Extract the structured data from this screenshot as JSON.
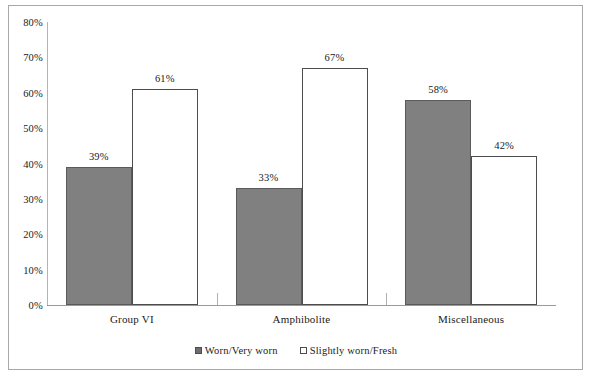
{
  "chart_data": {
    "type": "bar",
    "title": "",
    "subtitle": "",
    "xlabel": "",
    "ylabel": "",
    "categories": [
      "Group VI",
      "Amphibolite",
      "Miscellaneous"
    ],
    "series": [
      {
        "name": "Worn/Very worn",
        "values": [
          39,
          33,
          58
        ],
        "value_labels": [
          "39%",
          "33%",
          "58%"
        ],
        "color": "#808080",
        "style": "filled-gray"
      },
      {
        "name": "Slightly worn/Fresh",
        "values": [
          61,
          67,
          42
        ],
        "value_labels": [
          "61%",
          "67%",
          "42%"
        ],
        "color": "#ffffff",
        "style": "white-outlined"
      }
    ],
    "ylim": [
      0,
      80
    ],
    "ytick_step": 10,
    "ytick_labels": [
      "80%",
      "70%",
      "60%",
      "50%",
      "40%",
      "30%",
      "20%",
      "10%",
      "0%"
    ],
    "ytick_values": [
      80,
      70,
      60,
      50,
      40,
      30,
      20,
      10,
      0
    ],
    "grid": false,
    "legend_position": "bottom",
    "value_labels_shown": true,
    "units": "percent"
  },
  "legend": {
    "entries": [
      {
        "label": "Worn/Very worn",
        "swatch": "filled-square"
      },
      {
        "label": "Slightly worn/Fresh",
        "swatch": "hollow-square"
      }
    ]
  },
  "colors": {
    "series_1_fill": "#808080",
    "series_1_stroke": "#5a5a5a",
    "series_2_fill": "#ffffff",
    "series_2_stroke": "#4d4d4d",
    "axis": "#9a9a9a",
    "frame": "#a8a8a8",
    "text": "#1a1a1a"
  }
}
